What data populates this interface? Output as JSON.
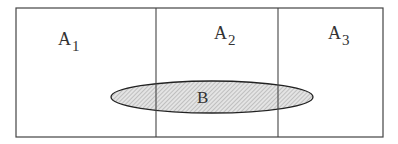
{
  "diagram": {
    "type": "venn-partition",
    "partitions": [
      {
        "label": "A",
        "subscript": "1"
      },
      {
        "label": "A",
        "subscript": "2"
      },
      {
        "label": "A",
        "subscript": "3"
      }
    ],
    "event": {
      "label": "B"
    },
    "colors": {
      "stroke": "#333333",
      "fill": "#d0d0d0",
      "background": "#ffffff"
    }
  }
}
